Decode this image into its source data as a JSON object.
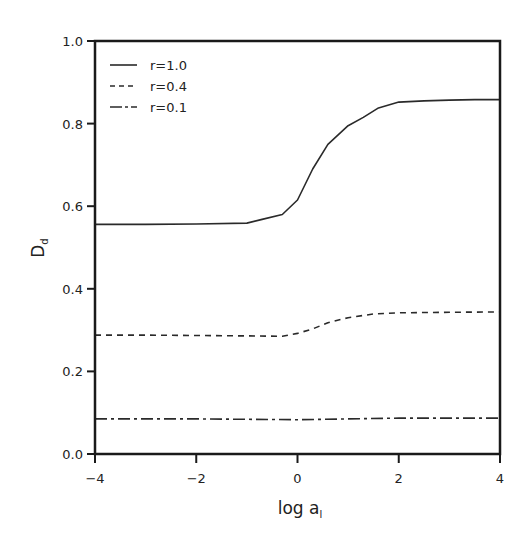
{
  "chart_data": {
    "type": "line",
    "title": "",
    "xlabel": "log a",
    "xlabel_subscript": "l",
    "ylabel": "D",
    "ylabel_subscript": "d",
    "xlim": [
      -4,
      4
    ],
    "ylim": [
      0.0,
      1.0
    ],
    "x_ticks": [
      -4,
      -2,
      0,
      2,
      4
    ],
    "x_tick_labels": [
      "−4",
      "−2",
      "0",
      "2",
      "4"
    ],
    "y_ticks": [
      0.0,
      0.2,
      0.4,
      0.6,
      0.8,
      1.0
    ],
    "y_tick_labels": [
      "0.0",
      "0.2",
      "0.4",
      "0.6",
      "0.8",
      "1.0"
    ],
    "grid": false,
    "legend_position": "upper left",
    "series": [
      {
        "name": "r=1.0",
        "style": "solid",
        "x": [
          -4.0,
          -3.0,
          -2.0,
          -1.0,
          -0.7,
          -0.3,
          0.0,
          0.3,
          0.6,
          1.0,
          1.3,
          1.6,
          2.0,
          2.5,
          3.0,
          3.5,
          4.0
        ],
        "y": [
          0.556,
          0.556,
          0.557,
          0.559,
          0.568,
          0.58,
          0.615,
          0.69,
          0.75,
          0.795,
          0.815,
          0.838,
          0.852,
          0.855,
          0.857,
          0.858,
          0.858
        ]
      },
      {
        "name": "r=0.4",
        "style": "dashed",
        "x": [
          -4.0,
          -3.0,
          -2.0,
          -1.0,
          -0.3,
          0.0,
          0.3,
          0.6,
          1.0,
          1.5,
          2.0,
          3.0,
          4.0
        ],
        "y": [
          0.288,
          0.288,
          0.287,
          0.286,
          0.285,
          0.292,
          0.303,
          0.318,
          0.33,
          0.339,
          0.342,
          0.343,
          0.344
        ]
      },
      {
        "name": "r=0.1",
        "style": "dashdot",
        "x": [
          -4.0,
          -2.0,
          -1.0,
          0.0,
          1.0,
          2.0,
          3.0,
          4.0
        ],
        "y": [
          0.085,
          0.085,
          0.084,
          0.083,
          0.085,
          0.087,
          0.087,
          0.087
        ]
      }
    ]
  },
  "style": {
    "line_color": "#2a2a2a",
    "axis_color": "#1a1a1a",
    "background": "#ffffff"
  }
}
